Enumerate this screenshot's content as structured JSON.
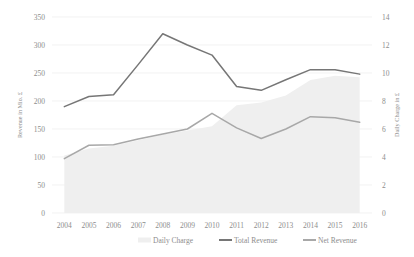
{
  "chart_data": {
    "type": "line",
    "title": "",
    "subtitle": "",
    "xlabel": "",
    "ylabel": "Revenue in Mio. £",
    "y2label": "Daily Charge in £",
    "categories": [
      "2004",
      "2005",
      "2006",
      "2007",
      "2008",
      "2009",
      "2010",
      "2011",
      "2012",
      "2013",
      "2014",
      "2015",
      "2016"
    ],
    "ylim": [
      0,
      350
    ],
    "y2lim": [
      0,
      14
    ],
    "yticks": [
      "0",
      "50",
      "100",
      "150",
      "200",
      "250",
      "300",
      "350"
    ],
    "y2ticks": [
      "0",
      "2",
      "4",
      "6",
      "8",
      "10",
      "12",
      "14"
    ],
    "grid": true,
    "legend_position": "bottom-center",
    "series": [
      {
        "name": "Daily Charge",
        "type": "area",
        "axis": "right",
        "color": "#efefef",
        "values": [
          4.1,
          4.6,
          4.8,
          5.2,
          5.6,
          5.9,
          6.2,
          7.7,
          7.9,
          8.4,
          9.5,
          9.8,
          9.7
        ]
      },
      {
        "name": "Total Revenue",
        "type": "line",
        "axis": "left",
        "color": "#767676",
        "values": [
          190,
          208,
          211,
          265,
          320,
          300,
          282,
          226,
          219,
          238,
          256,
          256,
          248
        ]
      },
      {
        "name": "Net Revenue",
        "type": "line",
        "axis": "left",
        "color": "#a8a8a8",
        "values": [
          97,
          121,
          122,
          132,
          141,
          150,
          178,
          152,
          133,
          150,
          172,
          170,
          162
        ]
      }
    ]
  },
  "legend": {
    "items": [
      {
        "label": "Daily Charge",
        "marker": "area-swatch"
      },
      {
        "label": "Total Revenue",
        "marker": "line-swatch"
      },
      {
        "label": "Net Revenue",
        "marker": "line-swatch"
      }
    ]
  },
  "colors": {
    "area_fill": "#efefef",
    "total_revenue": "#767676",
    "net_revenue": "#a8a8a8",
    "gridline": "#ededed",
    "text": "#8d8d8d",
    "background": "#ffffff"
  }
}
